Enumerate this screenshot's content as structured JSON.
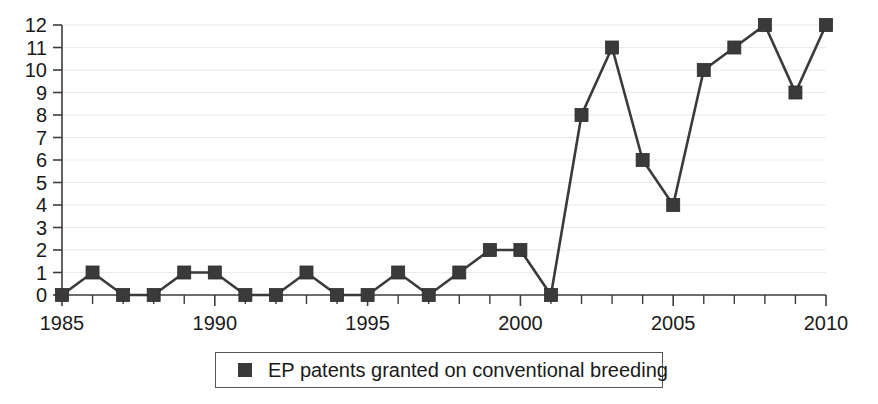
{
  "chart_data": {
    "type": "line",
    "title": "",
    "xlabel": "",
    "ylabel": "",
    "x": [
      1985,
      1986,
      1987,
      1988,
      1989,
      1990,
      1991,
      1992,
      1993,
      1994,
      1995,
      1996,
      1997,
      1998,
      1999,
      2000,
      2001,
      2002,
      2003,
      2004,
      2005,
      2006,
      2007,
      2008,
      2009,
      2010
    ],
    "series": [
      {
        "name": "EP patents granted on conventional breeding",
        "values": [
          0,
          1,
          0,
          0,
          1,
          1,
          0,
          0,
          1,
          0,
          0,
          1,
          0,
          1,
          2,
          2,
          0,
          8,
          11,
          6,
          4,
          10,
          11,
          12,
          9,
          12
        ],
        "color": "#3a3a3a",
        "marker": "square"
      }
    ],
    "xlim": [
      1985,
      2010
    ],
    "ylim": [
      0,
      12
    ],
    "x_major_ticks": [
      1985,
      1990,
      1995,
      2000,
      2005,
      2010
    ],
    "x_tick_labels": [
      "1985",
      "1990",
      "1995",
      "2000",
      "2005",
      "2010"
    ],
    "y_ticks": [
      0,
      1,
      2,
      3,
      4,
      5,
      6,
      7,
      8,
      9,
      10,
      11,
      12
    ],
    "y_tick_labels": [
      "0",
      "1",
      "2",
      "3",
      "4",
      "5",
      "6",
      "7",
      "8",
      "9",
      "10",
      "11",
      "12"
    ],
    "grid": true,
    "grid_color": "#e9e9ef",
    "legend_position": "bottom",
    "legend_entries": [
      "EP patents granted on conventional breeding"
    ]
  },
  "legend": {
    "label": "EP patents granted on conventional breeding",
    "swatch_color": "#3a3a3a"
  },
  "axes": {
    "axis_color": "#3d3d3d"
  }
}
